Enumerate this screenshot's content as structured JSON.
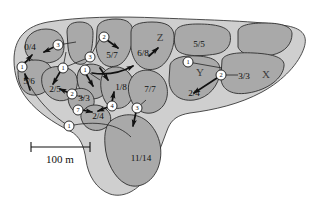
{
  "figure": {
    "colors": {
      "halo_fill": "#cfcfcf",
      "patch_fill": "#a9a9a9",
      "outline": "#2e2e2e",
      "arrow": "#111111",
      "node_fill": "#ffffff",
      "background": "#ffffff"
    }
  },
  "scale_bar": {
    "label": "100 m",
    "length_px": 84
  },
  "zone_labels": [
    {
      "name": "zone-z",
      "text": "Z",
      "x": 160,
      "y": 41
    },
    {
      "name": "zone-y",
      "text": "Y",
      "x": 200,
      "y": 74
    },
    {
      "name": "zone-x",
      "text": "X",
      "x": 266,
      "y": 76
    }
  ],
  "patches": [
    {
      "id": "p-0-4",
      "label": "0/4",
      "x": 38,
      "y": 47
    },
    {
      "id": "p-5-6",
      "label": "5/6",
      "x": 29,
      "y": 81
    },
    {
      "id": "p-2-5",
      "label": "2/5",
      "x": 54,
      "y": 89
    },
    {
      "id": "p-5-7",
      "label": "5/7",
      "x": 111,
      "y": 55
    },
    {
      "id": "p-6-8",
      "label": "6/8",
      "x": 142,
      "y": 53
    },
    {
      "id": "p-5-5",
      "label": "5/5",
      "x": 198,
      "y": 44
    },
    {
      "id": "p-3-3-r",
      "label": "3/3",
      "x": 242,
      "y": 76
    },
    {
      "id": "p-2-4-r",
      "label": "2/4",
      "x": 194,
      "y": 93
    },
    {
      "id": "p-1-8",
      "label": "1/8",
      "x": 119,
      "y": 87
    },
    {
      "id": "p-7-7",
      "label": "7/7",
      "x": 150,
      "y": 90
    },
    {
      "id": "p-3-3-l",
      "label": "3/3",
      "x": 84,
      "y": 98
    },
    {
      "id": "p-2-4-l",
      "label": "2/4",
      "x": 97,
      "y": 116
    },
    {
      "id": "p-11-14",
      "label": "11/14",
      "x": 140,
      "y": 158
    }
  ],
  "event_nodes": [
    {
      "id": "n-a",
      "value": "3",
      "x": 58,
      "y": 45
    },
    {
      "id": "n-b",
      "value": "1",
      "x": 22,
      "y": 67
    },
    {
      "id": "n-c",
      "value": "1",
      "x": 63,
      "y": 68
    },
    {
      "id": "n-d",
      "value": "1",
      "x": 85,
      "y": 70
    },
    {
      "id": "n-e",
      "value": "3",
      "x": 90,
      "y": 57
    },
    {
      "id": "n-f",
      "value": "2",
      "x": 104,
      "y": 37
    },
    {
      "id": "n-g",
      "value": "2",
      "x": 72,
      "y": 94
    },
    {
      "id": "n-h",
      "value": "7",
      "x": 78,
      "y": 110
    },
    {
      "id": "n-i",
      "value": "4",
      "x": 112,
      "y": 106
    },
    {
      "id": "n-j",
      "value": "3",
      "x": 137,
      "y": 108
    },
    {
      "id": "n-k",
      "value": "1",
      "x": 188,
      "y": 62
    },
    {
      "id": "n-l",
      "value": "2",
      "x": 221,
      "y": 75
    },
    {
      "id": "n-m",
      "value": "1",
      "x": 69,
      "y": 126
    }
  ]
}
